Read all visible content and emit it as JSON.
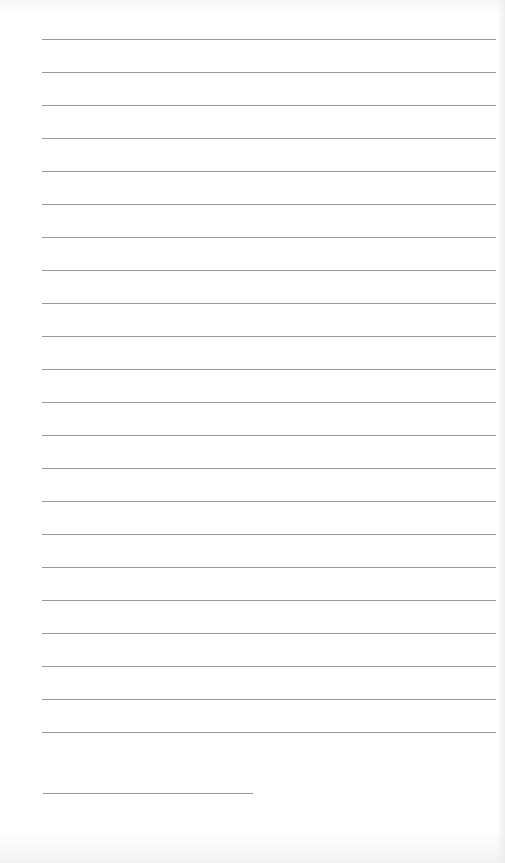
{
  "page": {
    "type": "lined-notebook-page",
    "background_color": "#ffffff",
    "line_color": "#9a9a9a",
    "full_lines": {
      "count": 22,
      "left": 42,
      "right": 496,
      "first_top": 39,
      "spacing": 33
    },
    "short_line": {
      "left": 43,
      "right": 253,
      "top": 793
    }
  }
}
